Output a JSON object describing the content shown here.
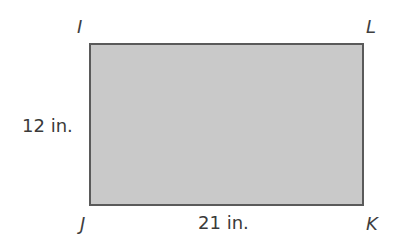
{
  "diagram": {
    "shape": "rectangle",
    "fill_color": "#c9c9c9",
    "stroke_color": "#5a5a5a",
    "vertices": {
      "top_left": "I",
      "top_right": "L",
      "bottom_left": "J",
      "bottom_right": "K"
    },
    "dimensions": {
      "left_side": "12 in.",
      "bottom_side": "21 in."
    }
  }
}
